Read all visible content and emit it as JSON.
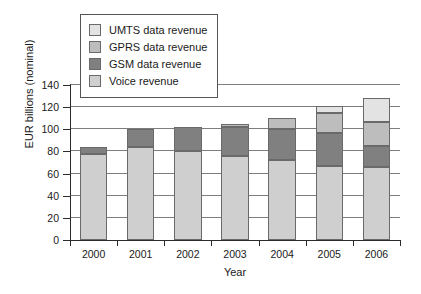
{
  "chart_data": {
    "type": "bar",
    "subtype": "stacked-bar",
    "title": "",
    "xlabel": "Year",
    "ylabel": "EUR billions (nominal)",
    "categories": [
      "2000",
      "2001",
      "2002",
      "2003",
      "2004",
      "2005",
      "2006"
    ],
    "ylim": [
      0,
      140
    ],
    "yticks": [
      0,
      20,
      40,
      60,
      80,
      100,
      120,
      140
    ],
    "ytick_labels": [
      "0",
      "20",
      "40",
      "60",
      "80",
      "100",
      "120",
      "140"
    ],
    "grid": "horizontal",
    "legend_position": "upper-left",
    "stack_order_bottom_to_top": [
      "Voice revenue",
      "GSM data revenue",
      "GPRS data revenue",
      "UMTS data revenue"
    ],
    "series": [
      {
        "name": "UMTS data revenue",
        "color": "#e3e3e3",
        "values": [
          0,
          0,
          0,
          0,
          0,
          6,
          21
        ]
      },
      {
        "name": "GPRS data revenue",
        "color": "#bdbdbd",
        "values": [
          0,
          0,
          0,
          3,
          10,
          18,
          22
        ]
      },
      {
        "name": "GSM data revenue",
        "color": "#808080",
        "values": [
          6,
          16,
          22,
          26,
          28,
          30,
          19
        ]
      },
      {
        "name": "Voice revenue",
        "color": "#cfcfcf",
        "values": [
          78,
          84,
          80,
          76,
          72,
          67,
          66
        ]
      }
    ],
    "totals": [
      84,
      100,
      102,
      105,
      110,
      121,
      128
    ]
  },
  "legend": {
    "items": [
      {
        "label": "UMTS data revenue",
        "swatch": "#e3e3e3"
      },
      {
        "label": "GPRS data revenue",
        "swatch": "#bdbdbd"
      },
      {
        "label": "GSM data revenue",
        "swatch": "#808080"
      },
      {
        "label": "Voice revenue",
        "swatch": "#cfcfcf"
      }
    ]
  },
  "colors": {
    "axis": "#2b2b2b",
    "grid": "#7d7d7d",
    "bar_outline": "#6a6a6a",
    "background": "#ffffff"
  }
}
